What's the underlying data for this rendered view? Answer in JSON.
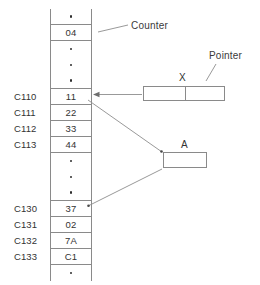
{
  "diagram": {
    "memory_column": {
      "cells": [
        {
          "kind": "ellipsis",
          "value": "•",
          "address": ""
        },
        {
          "kind": "value",
          "value": "04",
          "address": ""
        },
        {
          "kind": "ellipsis",
          "value": "•",
          "address": ""
        },
        {
          "kind": "ellipsis",
          "value": "•",
          "address": ""
        },
        {
          "kind": "ellipsis",
          "value": "•",
          "address": ""
        },
        {
          "kind": "value",
          "value": "11",
          "address": "C110"
        },
        {
          "kind": "value",
          "value": "22",
          "address": "C111"
        },
        {
          "kind": "value",
          "value": "33",
          "address": "C112"
        },
        {
          "kind": "value",
          "value": "44",
          "address": "C113"
        },
        {
          "kind": "ellipsis",
          "value": "•",
          "address": ""
        },
        {
          "kind": "ellipsis",
          "value": "•",
          "address": ""
        },
        {
          "kind": "ellipsis",
          "value": "•",
          "address": ""
        },
        {
          "kind": "value",
          "value": "37",
          "address": "C130"
        },
        {
          "kind": "value",
          "value": "02",
          "address": "C131"
        },
        {
          "kind": "value",
          "value": "7A",
          "address": "C132"
        },
        {
          "kind": "value",
          "value": "C1",
          "address": "C133"
        },
        {
          "kind": "ellipsis",
          "value": "•",
          "address": ""
        }
      ]
    },
    "labels": {
      "counter": "Counter",
      "pointer": "Pointer"
    },
    "boxes": [
      {
        "id": "x-box",
        "caption": "X",
        "cells": 2
      },
      {
        "id": "a-box",
        "caption": "A",
        "cells": 1
      }
    ],
    "colors": {
      "stroke": "#8a8a8a",
      "connector": "#8d8d8d",
      "text": "#333333",
      "background": "#ffffff"
    }
  }
}
